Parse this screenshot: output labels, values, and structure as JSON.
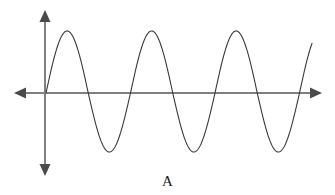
{
  "figure": {
    "caption": "A",
    "alt_title": "Sinusoidal wave on labelled coordinate axes",
    "background_color": "#ffffff"
  },
  "chart_data": {
    "type": "line",
    "title": "",
    "subtitle": "",
    "xlabel": "",
    "ylabel": "",
    "annotations": [
      "A"
    ],
    "grid": false,
    "legend": null,
    "axes": {
      "x_axis": {
        "name": "x-axis",
        "orientation": "horizontal",
        "color": "#808080",
        "stroke_width": 2,
        "y_pixel": 93,
        "x_start_pixel": 16,
        "x_end_pixel": 320,
        "arrowheads": [
          "left",
          "right"
        ],
        "tick_labels": [],
        "range": [
          -0.07,
          3.15
        ]
      },
      "y_axis": {
        "name": "y-axis",
        "orientation": "vertical",
        "color": "#808080",
        "stroke_width": 2,
        "x_pixel": 45,
        "y_start_pixel": 12,
        "y_end_pixel": 174,
        "arrowheads": [
          "up",
          "down"
        ],
        "tick_labels": [],
        "range": [
          -1.3,
          1.35
        ]
      }
    },
    "series": [
      {
        "name": "sine-wave",
        "color": "#3a3a3a",
        "stroke_width": 1.1,
        "function": "y = A * sin(2*pi*x / T)",
        "amplitude": 1,
        "period": 1,
        "phase": 0,
        "cycles_shown": 3.15,
        "origin_pixel": [
          46,
          93
        ],
        "period_pixels": 84.5,
        "amplitude_up_pixels": 62,
        "amplitude_down_pixels": 59,
        "start_pixel_x": 46,
        "end_pixel_x": 312,
        "peaks": [
          {
            "x_pixel": 68,
            "y_pixel": 31,
            "x": 0.25,
            "y": 1
          },
          {
            "x_pixel": 152,
            "y_pixel": 31,
            "x": 1.25,
            "y": 1
          },
          {
            "x_pixel": 237,
            "y_pixel": 31,
            "x": 2.25,
            "y": 1
          }
        ],
        "troughs": [
          {
            "x_pixel": 110,
            "y_pixel": 152,
            "x": 0.75,
            "y": -1
          },
          {
            "x_pixel": 195,
            "y_pixel": 152,
            "x": 1.75,
            "y": -1
          },
          {
            "x_pixel": 279,
            "y_pixel": 152,
            "x": 2.75,
            "y": -1
          }
        ],
        "zero_crossings": [
          {
            "x_pixel": 46,
            "x": 0,
            "direction": "rising"
          },
          {
            "x_pixel": 89,
            "x": 0.5,
            "direction": "falling"
          },
          {
            "x_pixel": 131,
            "x": 1.0,
            "direction": "rising"
          },
          {
            "x_pixel": 173,
            "x": 1.5,
            "direction": "falling"
          },
          {
            "x_pixel": 215,
            "x": 2.0,
            "direction": "rising"
          },
          {
            "x_pixel": 258,
            "x": 2.5,
            "direction": "falling"
          },
          {
            "x_pixel": 300,
            "x": 3.0,
            "direction": "rising"
          }
        ]
      }
    ]
  }
}
